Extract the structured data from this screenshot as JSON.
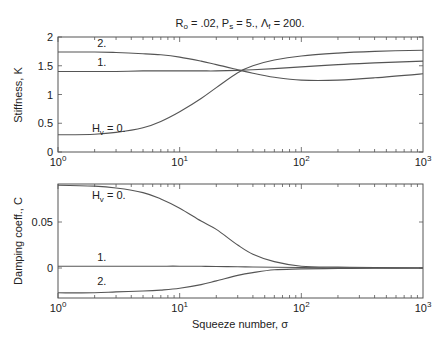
{
  "chart_data": [
    {
      "type": "line",
      "title": "R_o = .02, P_s = 5., Λ_f = 200.",
      "title_parts": {
        "r": "R",
        "r_sub": "o",
        "r_val": " = .02, ",
        "p": "P",
        "p_sub": "s",
        "p_val": " = 5.,  ",
        "l": "Λ",
        "l_sub": "f",
        "l_val": " = 200."
      },
      "xlabel": "",
      "ylabel": "Stiffness, K",
      "xscale": "log",
      "xlim": [
        1,
        1000
      ],
      "ylim": [
        0,
        2
      ],
      "yticks": [
        0,
        0.5,
        1,
        1.5,
        2
      ],
      "ytick_labels": [
        "0",
        "0.5",
        "1",
        "1.5",
        "2"
      ],
      "xticks": [
        1,
        10,
        100,
        1000
      ],
      "xtick_labels": [
        {
          "base": "10",
          "exp": "0"
        },
        {
          "base": "10",
          "exp": "1"
        },
        {
          "base": "10",
          "exp": "2"
        },
        {
          "base": "10",
          "exp": "3"
        }
      ],
      "grid": false,
      "x": [
        1,
        2,
        3,
        5,
        7,
        10,
        15,
        20,
        30,
        40,
        60,
        100,
        200,
        400,
        1000
      ],
      "series": [
        {
          "name": "H_v = 0.",
          "label": {
            "main": "H",
            "sub": "v",
            "rest": " = 0."
          },
          "label_at": [
            1.9,
            0.35
          ],
          "values": [
            0.3,
            0.31,
            0.34,
            0.42,
            0.53,
            0.7,
            0.93,
            1.12,
            1.38,
            1.5,
            1.6,
            1.67,
            1.72,
            1.75,
            1.77
          ]
        },
        {
          "name": "1.",
          "label": {
            "main": "1.",
            "sub": "",
            "rest": ""
          },
          "label_at": [
            2.1,
            1.5
          ],
          "values": [
            1.4,
            1.4,
            1.4,
            1.41,
            1.41,
            1.41,
            1.41,
            1.41,
            1.42,
            1.43,
            1.45,
            1.48,
            1.52,
            1.55,
            1.58
          ]
        },
        {
          "name": "2.",
          "label": {
            "main": "2.",
            "sub": "",
            "rest": ""
          },
          "label_at": [
            2.1,
            1.83
          ],
          "values": [
            1.74,
            1.74,
            1.73,
            1.71,
            1.69,
            1.65,
            1.58,
            1.52,
            1.43,
            1.37,
            1.3,
            1.25,
            1.25,
            1.29,
            1.36
          ]
        }
      ]
    },
    {
      "type": "line",
      "title": "",
      "xlabel": "Squeeze number, σ",
      "ylabel": "Damping coeff., C",
      "xscale": "log",
      "xlim": [
        1,
        1000
      ],
      "ylim": [
        -0.0326,
        0.0913
      ],
      "yticks": [
        0,
        0.05
      ],
      "ytick_labels": [
        "0",
        "0.05"
      ],
      "xticks": [
        1,
        10,
        100,
        1000
      ],
      "xtick_labels": [
        {
          "base": "10",
          "exp": "0"
        },
        {
          "base": "10",
          "exp": "1"
        },
        {
          "base": "10",
          "exp": "2"
        },
        {
          "base": "10",
          "exp": "3"
        }
      ],
      "grid": false,
      "x": [
        1,
        2,
        3,
        5,
        7,
        10,
        15,
        20,
        30,
        40,
        60,
        100,
        200,
        400,
        1000
      ],
      "series": [
        {
          "name": "H_v = 0.",
          "label": {
            "main": "H",
            "sub": "v",
            "rest": " = 0."
          },
          "label_at": [
            1.9,
            0.075
          ],
          "values": [
            0.09,
            0.089,
            0.087,
            0.082,
            0.075,
            0.065,
            0.051,
            0.042,
            0.025,
            0.015,
            0.007,
            0.002,
            0.001,
            0.0005,
            0.0
          ]
        },
        {
          "name": "1.",
          "label": {
            "main": "1.",
            "sub": "",
            "rest": ""
          },
          "label_at": [
            2.1,
            0.008
          ],
          "values": [
            0.002,
            0.002,
            0.002,
            0.002,
            0.002,
            0.002,
            0.0018,
            0.0016,
            0.0013,
            0.0011,
            0.0008,
            0.0005,
            0.0002,
            0.0001,
            0.0
          ]
        },
        {
          "name": "2.",
          "label": {
            "main": "2.",
            "sub": "",
            "rest": ""
          },
          "label_at": [
            2.1,
            -0.018
          ],
          "values": [
            -0.027,
            -0.027,
            -0.026,
            -0.025,
            -0.024,
            -0.022,
            -0.018,
            -0.014,
            -0.008,
            -0.005,
            -0.002,
            -0.001,
            -0.0005,
            -0.0002,
            0.0
          ]
        }
      ]
    }
  ]
}
